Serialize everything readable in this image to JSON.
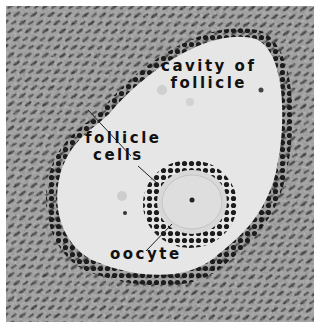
{
  "figure": {
    "labels": {
      "cavity_line1": "cavity of",
      "cavity_line2": "follicle",
      "follicle_cells_line1": "follicle",
      "follicle_cells_line2": "cells",
      "oocyte": "oocyte"
    },
    "colors": {
      "cavity": "#e6e6e6",
      "tissue": "#8a8a8a",
      "nuclei": "#1e1e1e",
      "oocyte": "#d8d8d8",
      "label_text": "#111111"
    }
  }
}
